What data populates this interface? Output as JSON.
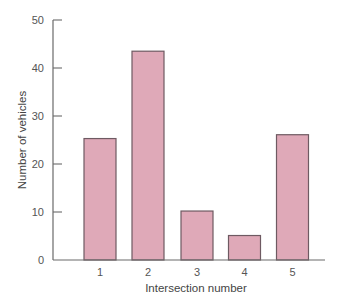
{
  "chart_data": {
    "type": "bar",
    "title": "",
    "xlabel": "Intersection number",
    "ylabel": "Number of vehicles",
    "categories": [
      "1",
      "2",
      "3",
      "4",
      "5"
    ],
    "values": [
      25.3,
      43.5,
      10.2,
      5.1,
      26.1
    ],
    "ylim": [
      0,
      50
    ],
    "yticks": [
      0,
      10,
      20,
      30,
      40,
      50
    ],
    "grid": false,
    "legend": null,
    "colors": {
      "bar_fill": "#dfa9b8",
      "bar_stroke": "#6e5a62",
      "axis": "#6a6a6a"
    }
  }
}
